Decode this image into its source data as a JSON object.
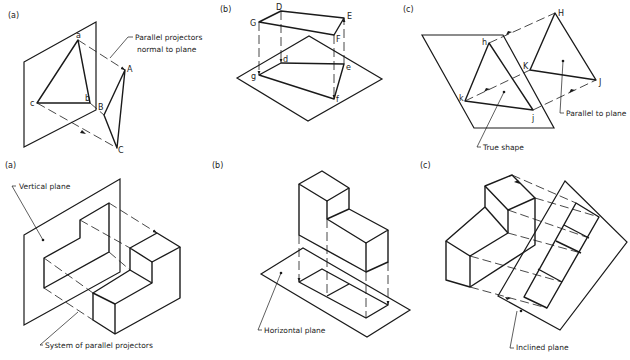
{
  "top_row": {
    "fig_a": {
      "label": "(a)",
      "points": {
        "a": "a",
        "b": "b",
        "c": "c",
        "A": "A",
        "B": "B",
        "C": "C"
      },
      "annotation": [
        "Parallel projectors",
        "normal to plane"
      ]
    },
    "fig_b": {
      "label": "(b)",
      "points": {
        "D": "D",
        "E": "E",
        "F": "F",
        "G": "G",
        "d": "d",
        "e": "e",
        "f": "f",
        "g": "g"
      }
    },
    "fig_c": {
      "label": "(c)",
      "points": {
        "h": "h",
        "k": "k",
        "j": "j",
        "H": "H",
        "K": "K",
        "J": "J"
      },
      "annotation_parallel": "Parallel to plane",
      "annotation_true": "True shape"
    }
  },
  "bottom_row": {
    "fig_a": {
      "label": "(a)",
      "annotation_plane": "Vertical plane",
      "annotation_projectors": "System of parallel projectors"
    },
    "fig_b": {
      "label": "(b)",
      "annotation_plane": "Horizontal plane"
    },
    "fig_c": {
      "label": "(c)",
      "annotation_plane": "Inclined plane"
    }
  }
}
